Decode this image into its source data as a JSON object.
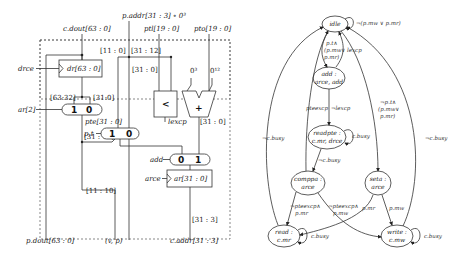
{
  "datapath": {
    "inputs": {
      "c_dout": "c.dout[63 : 0]",
      "p_addr": "p.addr[31 : 3] ∘ 0³",
      "ptl": "ptl[19 : 0]",
      "pto": "pto[19 : 0]"
    },
    "bit_labels": {
      "b11_0": "[11 : 0]",
      "b31_12_top": "[31 : 12]",
      "b31_0_mid": "[31 : 0]",
      "zero3": "0³",
      "zero12": "0¹²",
      "b63_32": "[63:32]",
      "b31_0_mux": "[31:0]",
      "b31_0_adder": "[31 : 0]",
      "b31_12_left": "[31 : 12]",
      "b11_10": "[11 : 10]",
      "b31_3": "[31 : 3]"
    },
    "registers": {
      "dr": "dr[63 : 0]",
      "ar": "ar[31 : 0]"
    },
    "controls": {
      "drce": "drce",
      "ar2": "ar[2]",
      "pt": "p.t",
      "add": "add",
      "arce": "arce",
      "lexcp": "lexcp"
    },
    "signals": {
      "pte": "pte[31 : 0]"
    },
    "mux_labels": {
      "mux1": [
        "1",
        "0"
      ],
      "mux2": [
        "1",
        "0"
      ],
      "mux3": [
        "0",
        "1"
      ]
    },
    "ops": {
      "compare": "<",
      "adder": "+"
    },
    "outputs": {
      "p_dout": "p.dout[63 : 0]",
      "vp": "(v, p)",
      "c_addr": "c.addr[31 : 3]"
    }
  },
  "fsm": {
    "states": {
      "idle": [
        "idle"
      ],
      "add": [
        "add :",
        "arce, add"
      ],
      "readpte": [
        "readpte :",
        "c.mr, drce"
      ],
      "comppa": [
        "comppa :",
        "arce"
      ],
      "seta": [
        "seta :",
        "arce"
      ],
      "read": [
        "read :",
        "c.mr"
      ],
      "write": [
        "write :",
        "c.mw"
      ]
    },
    "edges": {
      "idle_self": "¬(p.mw ∨ p.mr)",
      "idle_add": [
        "p.t∧",
        "(p.mw∨",
        "p.mr)"
      ],
      "add_idle": "lexcp",
      "add_readpte": "¬lexcp",
      "pteexcp": "pteexcp",
      "idle_seta": [
        "¬p.t∧",
        "(p.mw∨",
        "p.mr)"
      ],
      "readpte_self": "c.busy",
      "readpte_comppa": "¬c.busy",
      "comppa_read": [
        "¬pteexcp∧",
        "p.mr"
      ],
      "comppa_write": [
        "¬pteexcp∧",
        "p.mw"
      ],
      "seta_read": "p.mr",
      "seta_write": "p.mw",
      "read_self": "c.busy",
      "write_self": "c.busy",
      "read_idle": "¬c.busy",
      "write_idle": "¬c.busy"
    }
  }
}
